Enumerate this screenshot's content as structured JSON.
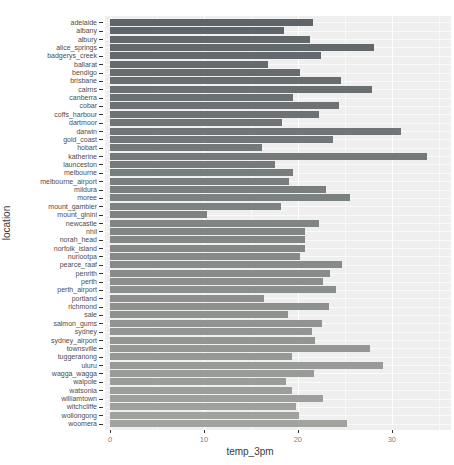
{
  "figure": {
    "background": "#ffffff",
    "panel_background": "#efefef",
    "gridline_color": "#ffffff",
    "tick_mark_color": "#333333",
    "axis_tick_text_color": "#7f7f7f",
    "category_text_color": "#4d4d4d",
    "axis_title_color": "#3a3a3a",
    "bar_color_top": "#5f6468",
    "bar_color_bottom": "#a0a39e"
  },
  "chart_data": {
    "type": "bar",
    "orientation": "horizontal",
    "title": "",
    "xlabel": "temp_3pm",
    "ylabel": "location",
    "xlim": [
      0,
      36.3
    ],
    "x_ticks": [
      0,
      10,
      20,
      30
    ],
    "x_minor_ticks": [
      5,
      15,
      25,
      35
    ],
    "grid": "on",
    "legend": "none",
    "categories": [
      "adelaide",
      "albany",
      "albury",
      "alice_springs",
      "badgerys_creek",
      "ballarat",
      "bendigo",
      "brisbane",
      "cairns",
      "canberra",
      "cobar",
      "coffs_harbour",
      "dartmoor",
      "darwin",
      "gold_coast",
      "hobart",
      "katherine",
      "launceston",
      "melbourne",
      "melbourne_airport",
      "mildura",
      "moree",
      "mount_gambier",
      "mount_ginini",
      "newcastle",
      "nhil",
      "norah_head",
      "norfolk_island",
      "nuriootpa",
      "pearce_raaf",
      "penrith",
      "perth",
      "perth_airport",
      "portland",
      "richmond",
      "sale",
      "salmon_gums",
      "sydney",
      "sydney_airport",
      "townsville",
      "tuggeranong",
      "uluru",
      "wagga_wagga",
      "walpole",
      "watsonia",
      "williamtown",
      "witchcliffe",
      "wollongong",
      "woomera"
    ],
    "values": [
      21.6,
      18.5,
      21.3,
      28.1,
      22.5,
      16.8,
      20.2,
      24.6,
      27.9,
      19.5,
      24.4,
      22.3,
      18.3,
      31.0,
      23.7,
      16.2,
      33.7,
      17.6,
      19.5,
      19.1,
      23.0,
      25.5,
      18.2,
      10.3,
      22.3,
      20.8,
      20.8,
      20.8,
      20.2,
      24.7,
      23.4,
      22.7,
      24.1,
      16.4,
      23.3,
      18.9,
      22.6,
      21.5,
      21.8,
      27.7,
      19.4,
      29.1,
      21.7,
      18.7,
      19.4,
      22.7,
      19.8,
      20.1,
      25.2
    ]
  }
}
